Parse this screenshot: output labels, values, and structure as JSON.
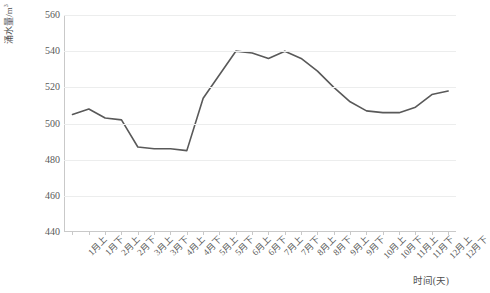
{
  "chart_data": {
    "type": "line",
    "title": "",
    "xlabel": "时间(天)",
    "ylabel": "涌水量/m³",
    "ylim": [
      440,
      560
    ],
    "ytick_values": [
      440,
      460,
      480,
      500,
      520,
      540,
      560
    ],
    "ytick_labels": [
      "440",
      "460",
      "480",
      "500",
      "520",
      "540",
      "560"
    ],
    "grid": true,
    "legend": "none",
    "line_color": "#595959",
    "line_width": 1.6,
    "markers": "none",
    "categories": [
      "1月上",
      "1月下",
      "2月上",
      "2月下",
      "3月上",
      "3月下",
      "4月上",
      "4月下",
      "5月上",
      "5月下",
      "6月上",
      "6月下",
      "7月上",
      "7月下",
      "8月上",
      "8月下",
      "9月上",
      "9月下",
      "10月上",
      "10月下",
      "11月上",
      "11月下",
      "12月上",
      "12月下"
    ],
    "values": [
      505,
      508,
      503,
      502,
      487,
      486,
      486,
      485,
      514,
      527,
      540,
      539,
      536,
      540,
      536,
      529,
      520,
      512,
      507,
      506,
      506,
      509,
      516,
      518
    ],
    "series": [
      {
        "name": "涌水量",
        "values": [
          505,
          508,
          503,
          502,
          487,
          486,
          486,
          485,
          514,
          527,
          540,
          539,
          536,
          540,
          536,
          529,
          520,
          512,
          507,
          506,
          506,
          509,
          516,
          518
        ]
      }
    ]
  },
  "axes": {
    "y_title_main": "涌水量/m",
    "y_title_sup": "3",
    "x_title": "时间(天)"
  }
}
